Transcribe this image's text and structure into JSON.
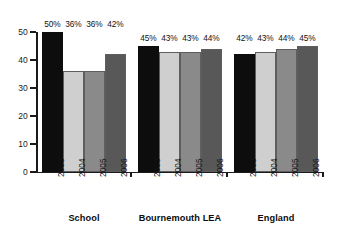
{
  "chart_data": {
    "type": "bar",
    "title": "",
    "subtitle": "",
    "xlabel": "",
    "ylabel": "",
    "ylim": [
      0,
      50
    ],
    "yticks": [
      0,
      10,
      20,
      30,
      40,
      50
    ],
    "ytick_labels": [
      "0",
      "10",
      "20",
      "30",
      "40",
      "50"
    ],
    "grid": false,
    "legend": "none",
    "categories": [
      "School",
      "Bournemouth LEA",
      "England"
    ],
    "series": [
      {
        "name": "2003",
        "values": [
          50,
          45,
          42
        ],
        "color": "#0d0d0d"
      },
      {
        "name": "2004",
        "values": [
          36,
          43,
          43
        ],
        "color": "#cfcfcf"
      },
      {
        "name": "2005",
        "values": [
          36,
          43,
          44
        ],
        "color": "#8a8a8a"
      },
      {
        "name": "2006",
        "values": [
          42,
          44,
          45
        ],
        "color": "#585858"
      }
    ],
    "groups": [
      {
        "label": "School",
        "bars": [
          {
            "year": "2003",
            "value": 50,
            "data_label": "50%",
            "color": "#0d0d0d"
          },
          {
            "year": "2004",
            "value": 36,
            "data_label": "36%",
            "color": "#cfcfcf"
          },
          {
            "year": "2005",
            "value": 36,
            "data_label": "36%",
            "color": "#8a8a8a"
          },
          {
            "year": "2006",
            "value": 42,
            "data_label": "42%",
            "color": "#585858"
          }
        ]
      },
      {
        "label": "Bournemouth LEA",
        "bars": [
          {
            "year": "2003",
            "value": 45,
            "data_label": "45%",
            "color": "#0d0d0d"
          },
          {
            "year": "2004",
            "value": 43,
            "data_label": "43%",
            "color": "#cfcfcf"
          },
          {
            "year": "2005",
            "value": 43,
            "data_label": "43%",
            "color": "#8a8a8a"
          },
          {
            "year": "2006",
            "value": 44,
            "data_label": "44%",
            "color": "#585858"
          }
        ]
      },
      {
        "label": "England",
        "bars": [
          {
            "year": "2003",
            "value": 42,
            "data_label": "42%",
            "color": "#0d0d0d"
          },
          {
            "year": "2004",
            "value": 43,
            "data_label": "43%",
            "color": "#cfcfcf"
          },
          {
            "year": "2005",
            "value": 44,
            "data_label": "44%",
            "color": "#8a8a8a"
          },
          {
            "year": "2006",
            "value": 45,
            "data_label": "45%",
            "color": "#585858"
          }
        ]
      }
    ],
    "axis_color": "#1a1a1a",
    "background_color": "#ffffff"
  }
}
